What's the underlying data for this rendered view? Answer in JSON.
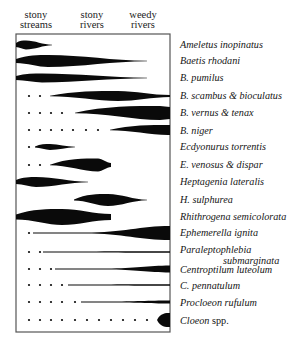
{
  "headers": [
    {
      "line1": "stony",
      "line2": "streams",
      "center_x": 36
    },
    {
      "line1": "stony",
      "line2": "rivers",
      "center_x": 92
    },
    {
      "line1": "weedy",
      "line2": "rivers",
      "center_x": 143
    }
  ],
  "frame": {
    "left": 16,
    "top": 34,
    "right": 170,
    "bottom": 332,
    "color": "#555555"
  },
  "ink_color": "#0a0a0a",
  "species": [
    {
      "label": "Ameletus inopinatus",
      "label_y": 39,
      "y": 45,
      "dots": [],
      "shape": {
        "x0": 16,
        "x1": 52,
        "peak_x": 26,
        "thick": 9,
        "w_left": 4,
        "w_right": 0.5
      }
    },
    {
      "label": "Baetis rhodani",
      "label_y": 55,
      "y": 61,
      "dots": [],
      "shape": {
        "x0": 16,
        "x1": 147,
        "peak_x": 48,
        "thick": 12,
        "w_left": 4,
        "w_right": 0.6
      }
    },
    {
      "label": "B. pumilus",
      "label_y": 72,
      "y": 78,
      "dots": [],
      "shape": {
        "x0": 16,
        "x1": 147,
        "peak_x": 42,
        "thick": 9,
        "w_left": 4,
        "w_right": 0.6
      }
    },
    {
      "label": "B. scambus & bioculatus",
      "label_y": 90,
      "y": 96,
      "dots": [
        29,
        40
      ],
      "shape": {
        "x0": 50,
        "x1": 170,
        "peak_x": 118,
        "thick": 10,
        "w_left": 0.6,
        "w_right": 2
      }
    },
    {
      "label": "B. vernus & tenax",
      "label_y": 107,
      "y": 113,
      "dots": [
        29,
        40,
        51,
        62
      ],
      "shape": {
        "x0": 75,
        "x1": 170,
        "peak_x": 160,
        "thick": 14,
        "w_left": 0.6,
        "w_right": 12
      }
    },
    {
      "label": "B. niger",
      "label_y": 125,
      "y": 130,
      "dots": [
        29,
        40,
        51,
        62,
        73,
        86,
        98
      ],
      "shape": {
        "x0": 110,
        "x1": 170,
        "peak_x": 168,
        "thick": 10,
        "w_left": 0.6,
        "w_right": 10
      }
    },
    {
      "label": "Ecdyonurus torrentis",
      "label_y": 141,
      "y": 147,
      "dots": [
        29
      ],
      "shape": {
        "x0": 35,
        "x1": 75,
        "peak_x": 50,
        "thick": 6,
        "w_left": 1,
        "w_right": 0.5
      }
    },
    {
      "label": "E. venosus & dispar",
      "label_y": 159,
      "y": 165,
      "dots": [
        29,
        40
      ],
      "shape": {
        "x0": 50,
        "x1": 111,
        "peak_x": 98,
        "thick": 13,
        "w_left": 0.6,
        "w_right": 4
      }
    },
    {
      "label": "Heptagenia lateralis",
      "label_y": 176,
      "y": 182,
      "dots": [],
      "shape": {
        "x0": 16,
        "x1": 88,
        "peak_x": 36,
        "thick": 10,
        "w_left": 4,
        "w_right": 0.6
      }
    },
    {
      "label": "H. sulphurea",
      "label_y": 194,
      "y": 200,
      "dots": [],
      "shape": {
        "x0": 74,
        "x1": 147,
        "peak_x": 108,
        "thick": 12,
        "w_left": 1,
        "w_right": 0.6
      }
    },
    {
      "label": "Rhithrogena semicolorata",
      "label_y": 211,
      "y": 217,
      "dots": [],
      "shape": {
        "x0": 16,
        "x1": 111,
        "peak_x": 62,
        "thick": 16,
        "w_left": 5,
        "w_right": 6
      }
    },
    {
      "label": "Ephemerella ignita",
      "label_y": 227,
      "y": 233,
      "dots": [
        29
      ],
      "shape": {
        "x0": 33,
        "x1": 170,
        "peak_x": 169,
        "thick": 14,
        "w_left": 0.8,
        "w_right": 14,
        "taper_start": 0.38
      }
    },
    {
      "label": "Paraleptophlebia",
      "label_sub": "submarginata",
      "label_y": 244,
      "y": 252,
      "dots": [
        29,
        40
      ],
      "shape": {
        "x0": 43,
        "x1": 170,
        "peak_x": 169,
        "thick": 1.4,
        "w_left": 1,
        "w_right": 1.4,
        "taper_start": 0
      }
    },
    {
      "label": "Centroptilum luteolum",
      "label_y": 264,
      "y": 269,
      "dots": [
        29,
        40,
        51
      ],
      "shape": {
        "x0": 55,
        "x1": 170,
        "peak_x": 169,
        "thick": 7,
        "w_left": 1,
        "w_right": 7,
        "taper_start": 0.45
      }
    },
    {
      "label": "C. pennatulum",
      "label_y": 280,
      "y": 285,
      "dots": [
        29,
        40,
        51,
        62
      ],
      "shape": {
        "x0": 68,
        "x1": 170,
        "peak_x": 169,
        "thick": 1.4,
        "w_left": 1,
        "w_right": 1.4,
        "taper_start": 0
      }
    },
    {
      "label": "Procloeon rufulum",
      "label_y": 297,
      "y": 302,
      "dots": [
        29,
        40,
        51,
        62,
        75
      ],
      "shape": {
        "x0": 81,
        "x1": 170,
        "peak_x": 169,
        "thick": 3,
        "w_left": 1,
        "w_right": 3,
        "taper_start": 0.3
      }
    },
    {
      "label": "Cloeon",
      "label_suffix": "spp.",
      "label_y": 315,
      "y": 320,
      "dots": [
        29,
        40,
        51,
        62,
        75,
        87,
        99,
        111,
        123,
        135,
        147
      ],
      "shape": {
        "x0": 157,
        "x1": 170,
        "peak_x": 170,
        "thick": 14,
        "w_left": 1,
        "w_right": 14,
        "blob": true
      }
    }
  ]
}
